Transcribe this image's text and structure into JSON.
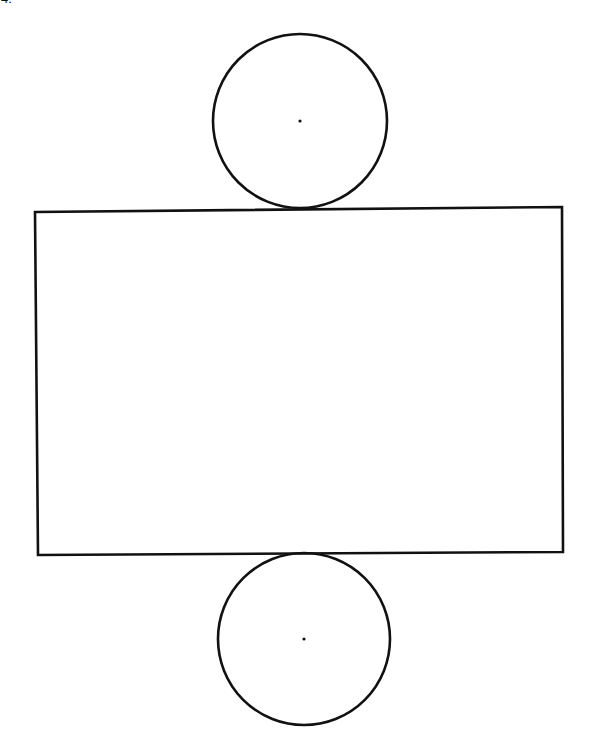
{
  "problem": {
    "number_label": "4."
  },
  "diagram": {
    "stroke_color": "#111111",
    "background": "#ffffff",
    "top_circle": {
      "cx": 300,
      "cy": 121,
      "r": 87,
      "center_dot": true
    },
    "rectangle": {
      "points": [
        [
          35,
          212
        ],
        [
          562,
          207
        ],
        [
          563,
          552
        ],
        [
          38,
          555
        ]
      ]
    },
    "bottom_circle": {
      "cx": 304,
      "cy": 639,
      "r": 86,
      "center_dot": true
    }
  }
}
